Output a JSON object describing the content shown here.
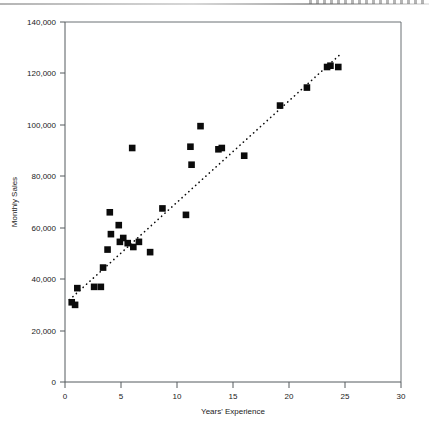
{
  "chart_data": {
    "type": "scatter",
    "title": "",
    "xlabel": "Years' Experience",
    "ylabel": "Monthly Sales",
    "xlim": [
      0,
      30
    ],
    "ylim": [
      0,
      140000
    ],
    "xticks": [
      "0",
      "5",
      "10",
      "15",
      "20",
      "25",
      "30"
    ],
    "xtick_values": [
      0,
      5,
      10,
      15,
      20,
      25,
      30
    ],
    "yticks": [
      "0",
      "20,000",
      "40,000",
      "60,000",
      "80,000",
      "100,000",
      "120,000",
      "140,000"
    ],
    "ytick_values": [
      0,
      20000,
      40000,
      60000,
      80000,
      100000,
      120000,
      140000
    ],
    "grid": false,
    "legend": false,
    "marker": "square",
    "marker_color": "#0b0b0b",
    "points": [
      {
        "x": 0.6,
        "y": 31000
      },
      {
        "x": 0.9,
        "y": 30000
      },
      {
        "x": 1.1,
        "y": 36500
      },
      {
        "x": 2.6,
        "y": 37000
      },
      {
        "x": 3.2,
        "y": 37000
      },
      {
        "x": 3.4,
        "y": 44500
      },
      {
        "x": 3.8,
        "y": 51500
      },
      {
        "x": 4.0,
        "y": 66000
      },
      {
        "x": 4.1,
        "y": 57500
      },
      {
        "x": 4.8,
        "y": 61000
      },
      {
        "x": 4.9,
        "y": 54500
      },
      {
        "x": 5.2,
        "y": 56000
      },
      {
        "x": 5.6,
        "y": 54000
      },
      {
        "x": 6.0,
        "y": 91000
      },
      {
        "x": 6.1,
        "y": 52500
      },
      {
        "x": 6.6,
        "y": 54500
      },
      {
        "x": 7.6,
        "y": 50500
      },
      {
        "x": 8.7,
        "y": 67500
      },
      {
        "x": 10.8,
        "y": 65000
      },
      {
        "x": 11.2,
        "y": 91500
      },
      {
        "x": 11.3,
        "y": 84500
      },
      {
        "x": 12.1,
        "y": 99500
      },
      {
        "x": 13.7,
        "y": 90500
      },
      {
        "x": 14.0,
        "y": 91000
      },
      {
        "x": 16.0,
        "y": 88000
      },
      {
        "x": 19.2,
        "y": 107500
      },
      {
        "x": 21.6,
        "y": 114500
      },
      {
        "x": 23.4,
        "y": 122500
      },
      {
        "x": 23.7,
        "y": 123000
      },
      {
        "x": 24.4,
        "y": 122500
      }
    ],
    "trendline": {
      "type": "linear",
      "style": "dotted",
      "x_start": 0.4,
      "y_start": 32000,
      "x_end": 24.6,
      "y_end": 127500
    }
  }
}
